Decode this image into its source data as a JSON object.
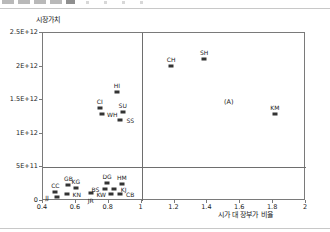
{
  "toolbar": {
    "present": true,
    "icon_count": 5,
    "dot_count": 4
  },
  "chart_data": {
    "type": "scatter",
    "title": "",
    "ylabel": "시장가치",
    "xlabel": "시가 대 장부가 비율",
    "xlim": [
      0.4,
      2.0
    ],
    "ylim": [
      0,
      2500000000000.0
    ],
    "xticks": [
      "0.4",
      "0.6",
      "0.8",
      "1",
      "1.2",
      "1.4",
      "1.6",
      "1.8",
      "2"
    ],
    "xtick_values": [
      0.4,
      0.6,
      0.8,
      1.0,
      1.2,
      1.4,
      1.6,
      1.8,
      2.0
    ],
    "yticks": [
      "0",
      "5E+11",
      "1E+12",
      "1.5E+12",
      "2E+12",
      "2.5E+12"
    ],
    "ytick_values": [
      0,
      500000000000,
      1000000000000,
      1500000000000,
      2000000000000,
      2500000000000
    ],
    "grid": false,
    "legend": "none",
    "reference_lines": [
      {
        "axis": "x",
        "value": 1.0
      },
      {
        "axis": "y",
        "value": 500000000000
      }
    ],
    "points": [
      {
        "label": "JJ",
        "x": 0.485,
        "y": 55000000000,
        "label_pos": "left",
        "marker": true
      },
      {
        "label": "CC",
        "x": 0.475,
        "y": 140000000000,
        "label_pos": "above",
        "marker": true
      },
      {
        "label": "KN",
        "x": 0.545,
        "y": 105000000000,
        "label_pos": "right",
        "marker": true
      },
      {
        "label": "GB",
        "x": 0.555,
        "y": 235000000000,
        "label_pos": "above",
        "marker": true
      },
      {
        "label": "KG",
        "x": 0.6,
        "y": 190000000000,
        "label_pos": "above",
        "marker": true
      },
      {
        "label": "JR",
        "x": 0.69,
        "y": 120000000000,
        "label_pos": "below",
        "marker": true
      },
      {
        "label": "BS",
        "x": 0.78,
        "y": 185000000000,
        "label_pos": "left",
        "marker": true
      },
      {
        "label": "DG",
        "x": 0.79,
        "y": 265000000000,
        "label_pos": "above",
        "marker": true
      },
      {
        "label": "KJ",
        "x": 0.83,
        "y": 185000000000,
        "label_pos": "right",
        "marker": true
      },
      {
        "label": "KW",
        "x": 0.815,
        "y": 105000000000,
        "label_pos": "left",
        "marker": true
      },
      {
        "label": "CB",
        "x": 0.87,
        "y": 110000000000,
        "label_pos": "right",
        "marker": true
      },
      {
        "label": "HM",
        "x": 0.88,
        "y": 250000000000,
        "label_pos": "above",
        "marker": true
      },
      {
        "label": "CI",
        "x": 0.745,
        "y": 1390000000000,
        "label_pos": "above",
        "marker": true
      },
      {
        "label": "WH",
        "x": 0.76,
        "y": 1300000000000,
        "label_pos": "right",
        "marker": true
      },
      {
        "label": "HI",
        "x": 0.85,
        "y": 1620000000000,
        "label_pos": "above",
        "marker": true
      },
      {
        "label": "SU",
        "x": 0.885,
        "y": 1330000000000,
        "label_pos": "above",
        "marker": true
      },
      {
        "label": "SS",
        "x": 0.87,
        "y": 1200000000000,
        "label_pos": "right",
        "marker": true
      },
      {
        "label": "CH",
        "x": 1.18,
        "y": 2010000000000,
        "label_pos": "above",
        "marker": true
      },
      {
        "label": "SH",
        "x": 1.38,
        "y": 2110000000000,
        "label_pos": "above",
        "marker": true
      },
      {
        "label": "(A)",
        "x": 1.53,
        "y": 1480000000000,
        "label_pos": "center",
        "marker": false
      },
      {
        "label": "KM",
        "x": 1.81,
        "y": 1300000000000,
        "label_pos": "above",
        "marker": true
      }
    ]
  }
}
